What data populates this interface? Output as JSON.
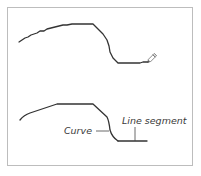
{
  "figure": {
    "panels": [
      {
        "name": "drawing-in-progress",
        "description": "Freehand stroke being drawn with pencil tool",
        "tool_icon": "pencil-icon"
      },
      {
        "name": "result",
        "description": "Resulting path with labeled parts",
        "labels": {
          "curve": "Curve",
          "line_segment": "Line segment"
        }
      }
    ],
    "colors": {
      "stroke": "#333333",
      "border": "#bdbdbd",
      "label": "#3a3a3a"
    }
  }
}
